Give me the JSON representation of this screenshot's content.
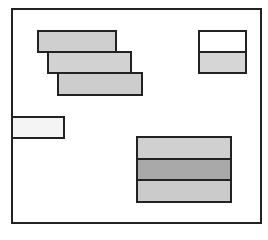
{
  "diagram": {
    "frame": {
      "x": 11,
      "y": 8,
      "w": 251,
      "h": 216
    },
    "boxes": [
      {
        "name": "staggered-box-1",
        "x": 37,
        "y": 30,
        "w": 80,
        "h": 23,
        "fill": "#cfcfcf"
      },
      {
        "name": "staggered-box-2",
        "x": 47,
        "y": 51,
        "w": 85,
        "h": 23,
        "fill": "#d2d2d2"
      },
      {
        "name": "staggered-box-3",
        "x": 57,
        "y": 72,
        "w": 86,
        "h": 24,
        "fill": "#cdcdcd"
      },
      {
        "name": "top-right-box-upper",
        "x": 198,
        "y": 30,
        "w": 49,
        "h": 23,
        "fill": "#ffffff"
      },
      {
        "name": "top-right-box-lower",
        "x": 198,
        "y": 51,
        "w": 49,
        "h": 23,
        "fill": "#d6d6d6"
      },
      {
        "name": "left-edge-box",
        "x": 11,
        "y": 116,
        "w": 54,
        "h": 23,
        "fill": "#f4f4f4"
      },
      {
        "name": "stack-box-top",
        "x": 136,
        "y": 136,
        "w": 96,
        "h": 24,
        "fill": "#d0d0d0"
      },
      {
        "name": "stack-box-middle",
        "x": 136,
        "y": 158,
        "w": 96,
        "h": 23,
        "fill": "#a9a9a9"
      },
      {
        "name": "stack-box-bottom",
        "x": 136,
        "y": 179,
        "w": 96,
        "h": 24,
        "fill": "#cbcbcb"
      }
    ]
  }
}
